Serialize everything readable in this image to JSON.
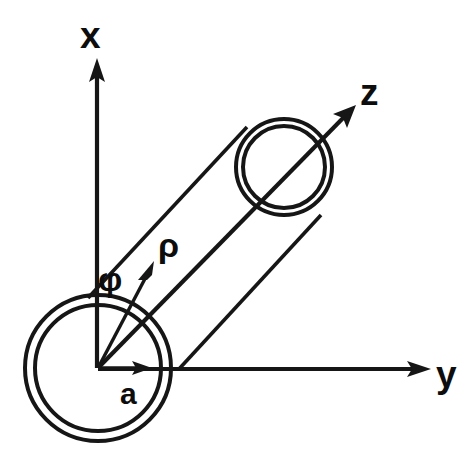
{
  "figure": {
    "background_color": "#ffffff",
    "ink_color": "#161616",
    "width": 476,
    "height": 475
  },
  "axes": [
    {
      "id": "x-axis",
      "label": "x",
      "icon": "arrow-up-icon",
      "origin": [
        98,
        368
      ],
      "tip": [
        96,
        62
      ],
      "label_pos": [
        82,
        48
      ],
      "direction": "up"
    },
    {
      "id": "y-axis",
      "label": "y",
      "icon": "arrow-right-icon",
      "origin": [
        98,
        368
      ],
      "tip": [
        428,
        369
      ],
      "label_pos": [
        437,
        385
      ],
      "direction": "right"
    },
    {
      "id": "z-axis",
      "label": "z",
      "icon": "arrow-up-right-icon",
      "origin": [
        98,
        368
      ],
      "tip": [
        354,
        107
      ],
      "label_pos": [
        362,
        104
      ],
      "direction": "up-right"
    }
  ],
  "vectors": [
    {
      "id": "rho-vector",
      "label": "ρ",
      "icon": "arrow-up-right-icon",
      "origin": [
        98,
        368
      ],
      "tip": [
        153,
        264
      ],
      "label_pos": [
        158,
        256
      ]
    },
    {
      "id": "a-vector",
      "label": "a",
      "icon": "arrow-right-icon",
      "origin": [
        98,
        368
      ],
      "tip": [
        148,
        368
      ],
      "label_pos": [
        121,
        404
      ]
    }
  ],
  "angles": [
    {
      "id": "phi-angle",
      "label": "φ",
      "label_pos": [
        98,
        290
      ],
      "vertex": [
        98,
        368
      ],
      "between": [
        "x-axis",
        "rho-vector"
      ]
    }
  ],
  "cylinder": {
    "near_face": {
      "id": "near-circle",
      "center": [
        98,
        368
      ],
      "outer_radius": 73,
      "inner_radius": 63
    },
    "far_face": {
      "id": "far-circle",
      "center": [
        284,
        167
      ],
      "outer_radius": 48,
      "inner_radius": 42
    },
    "side_lines": [
      {
        "id": "cylinder-edge-upper",
        "from": [
          88,
          298
        ],
        "to": [
          246,
          128
        ]
      },
      {
        "id": "cylinder-edge-lower",
        "from": [
          179,
          369
        ],
        "to": [
          320,
          216
        ]
      }
    ]
  },
  "labels": {
    "x": "x",
    "y": "y",
    "z": "z",
    "rho": "ρ",
    "phi": "φ",
    "a": "a"
  }
}
